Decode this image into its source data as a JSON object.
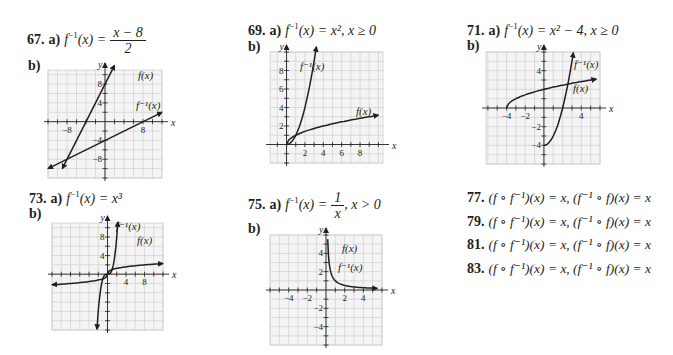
{
  "problems": [
    {
      "number": "67.",
      "part_a": "a)",
      "answer_lhs": "f",
      "answer_sup": "−1",
      "answer_var": "(x) =",
      "frac_num": "x − 8",
      "frac_den": "2",
      "part_b": "b)"
    },
    {
      "number": "69.",
      "part_a": "a)",
      "answer_text": "(x) = x², x ≥ 0",
      "part_b": "b)"
    },
    {
      "number": "71.",
      "part_a": "a)",
      "answer_text": "(x) = x² − 4, x ≥ 0",
      "part_b": "b)"
    },
    {
      "number": "73.",
      "part_a": "a)",
      "answer_text": "(x) = x³",
      "part_b": "b)"
    },
    {
      "number": "75.",
      "part_a": "a)",
      "answer_lhs_text": "(x) =",
      "frac_num": "1",
      "frac_den": "x",
      "answer_tail": ", x > 0",
      "part_b": "b)"
    }
  ],
  "compositions": [
    {
      "number": "77.",
      "text": "(f ∘ f⁻¹)(x) = x, (f⁻¹ ∘ f)(x) = x"
    },
    {
      "number": "79.",
      "text": "(f ∘ f⁻¹)(x) = x, (f⁻¹ ∘ f)(x) = x"
    },
    {
      "number": "81.",
      "text": "(f ∘ f⁻¹)(x) = x, (f⁻¹ ∘ f)(x) = x"
    },
    {
      "number": "83.",
      "text": "(f ∘ f⁻¹)(x) = x, (f⁻¹ ∘ f)(x) = x"
    }
  ],
  "labels": {
    "f": "f(x)",
    "finv": "f⁻¹(x)",
    "x": "x",
    "y": "y",
    "finv_prefix": "f"
  },
  "chart_data": [
    {
      "type": "line",
      "title": "67 b)",
      "xlabel": "x",
      "ylabel": "y",
      "xlim": [
        -12,
        12
      ],
      "ylim": [
        -12,
        12
      ],
      "grid": true,
      "xticks_labeled": [
        -8,
        8
      ],
      "yticks_labeled": [
        8,
        4,
        -4,
        -8
      ],
      "series": [
        {
          "name": "f(x)",
          "equation": "y = 2x + 8",
          "x": [
            -9,
            2
          ],
          "y": [
            -10,
            12
          ]
        },
        {
          "name": "f⁻¹(x)",
          "equation": "y = (x − 8)/2",
          "x": [
            -12,
            12
          ],
          "y": [
            -10,
            2
          ]
        }
      ]
    },
    {
      "type": "line",
      "title": "69 b)",
      "xlabel": "x",
      "ylabel": "y",
      "xlim": [
        -1,
        10
      ],
      "ylim": [
        -2,
        10
      ],
      "grid": true,
      "xticks_labeled": [
        2,
        4,
        6,
        8
      ],
      "yticks_labeled": [
        2,
        4,
        6,
        8
      ],
      "series": [
        {
          "name": "f(x)",
          "equation": "y = √x",
          "x": [
            0,
            1,
            4,
            9,
            10
          ],
          "y": [
            0,
            1,
            2,
            3,
            3.16
          ]
        },
        {
          "name": "f⁻¹(x)",
          "equation": "y = x², x ≥ 0",
          "x": [
            0,
            1,
            2,
            3,
            3.2
          ],
          "y": [
            0,
            1,
            4,
            9,
            10.2
          ]
        }
      ]
    },
    {
      "type": "line",
      "title": "71 b)",
      "xlabel": "x",
      "ylabel": "y",
      "xlim": [
        -6,
        6
      ],
      "ylim": [
        -6,
        6
      ],
      "grid": true,
      "xticks_labeled": [
        -4,
        -2,
        4
      ],
      "yticks_labeled": [
        4,
        -2,
        -4
      ],
      "series": [
        {
          "name": "f(x)",
          "equation": "y = √(x + 4)",
          "x": [
            -4,
            -3,
            0,
            5
          ],
          "y": [
            0,
            1,
            2,
            3
          ]
        },
        {
          "name": "f⁻¹(x)",
          "equation": "y = x² − 4, x ≥ 0",
          "x": [
            0,
            1,
            2,
            3,
            3.15
          ],
          "y": [
            -4,
            -3,
            0,
            5,
            5.9
          ]
        }
      ]
    },
    {
      "type": "line",
      "title": "73 b)",
      "xlabel": "x",
      "ylabel": "y",
      "xlim": [
        -12,
        12
      ],
      "ylim": [
        -12,
        12
      ],
      "grid": true,
      "xticks_labeled": [
        4,
        8
      ],
      "yticks_labeled": [
        8,
        4
      ],
      "series": [
        {
          "name": "f(x)",
          "equation": "y = ∛x",
          "x": [
            -12,
            -1,
            0,
            1,
            12
          ],
          "y": [
            -2.29,
            -1,
            0,
            1,
            2.29
          ]
        },
        {
          "name": "f⁻¹(x)",
          "equation": "y = x³",
          "x": [
            -2.3,
            -1,
            0,
            1,
            2.25
          ],
          "y": [
            -12.2,
            -1,
            0,
            1,
            11.4
          ]
        }
      ]
    },
    {
      "type": "line",
      "title": "75 b)",
      "xlabel": "x",
      "ylabel": "y",
      "xlim": [
        -6,
        6
      ],
      "ylim": [
        -6,
        6
      ],
      "grid": true,
      "xticks_labeled": [
        -4,
        -2,
        2,
        4
      ],
      "yticks_labeled": [
        4,
        2,
        -2,
        -4
      ],
      "series": [
        {
          "name": "f(x)",
          "equation": "y = 1/x, x > 0",
          "x": [
            0.18,
            0.5,
            1,
            2,
            5.5
          ],
          "y": [
            5.5,
            2,
            1,
            0.5,
            0.18
          ]
        },
        {
          "name": "f⁻¹(x)",
          "equation": "y = 1/x, x > 0",
          "x": [
            0.18,
            0.5,
            1,
            2,
            5.5
          ],
          "y": [
            5.5,
            2,
            1,
            0.5,
            0.18
          ]
        }
      ]
    }
  ]
}
